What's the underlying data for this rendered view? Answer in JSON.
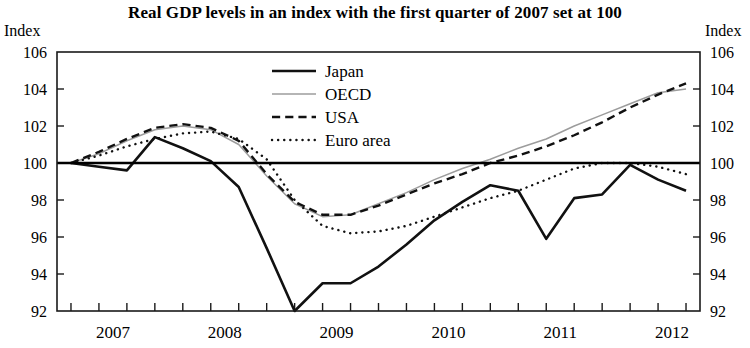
{
  "chart_data": {
    "type": "line",
    "title": "Real GDP levels in an index with the first quarter of 2007 set at 100",
    "xlabel": "",
    "ylabel": "Index",
    "ylabel_right": "Index",
    "ylim": [
      92,
      106
    ],
    "yticks": [
      92,
      94,
      96,
      98,
      100,
      102,
      104,
      106
    ],
    "ytick_labels": [
      "92",
      "94",
      "96",
      "98",
      "100",
      "102",
      "104",
      "106"
    ],
    "xlim": [
      2006.875,
      2012.625
    ],
    "xticks": [
      2007,
      2008,
      2009,
      2010,
      2011,
      2012
    ],
    "xtick_labels": [
      "2007",
      "2008",
      "2009",
      "2010",
      "2011",
      "2012"
    ],
    "x_minor_step": 0.25,
    "grid": false,
    "reference_line": 100,
    "legend_position": "upper center",
    "x": [
      2007.0,
      2007.25,
      2007.5,
      2007.75,
      2008.0,
      2008.25,
      2008.5,
      2008.75,
      2009.0,
      2009.25,
      2009.5,
      2009.75,
      2010.0,
      2010.25,
      2010.5,
      2010.75,
      2011.0,
      2011.25,
      2011.5,
      2011.75,
      2012.0,
      2012.25,
      2012.5
    ],
    "x_labels": [
      "2007Q1",
      "2007Q2",
      "2007Q3",
      "2007Q4",
      "2008Q1",
      "2008Q2",
      "2008Q3",
      "2008Q4",
      "2009Q1",
      "2009Q2",
      "2009Q3",
      "2009Q4",
      "2010Q1",
      "2010Q2",
      "2010Q3",
      "2010Q4",
      "2011Q1",
      "2011Q2",
      "2011Q3",
      "2011Q4",
      "2012Q1",
      "2012Q2",
      "2012Q3"
    ],
    "series": [
      {
        "name": "Japan",
        "style": "solid",
        "width": 2.6,
        "color": "#111111",
        "values": [
          100.0,
          99.8,
          99.6,
          101.4,
          100.8,
          100.1,
          98.7,
          95.4,
          92.0,
          93.5,
          93.5,
          94.4,
          95.6,
          96.9,
          97.9,
          98.8,
          98.5,
          95.9,
          98.1,
          98.3,
          99.9,
          99.1,
          98.5
        ]
      },
      {
        "name": "OECD",
        "style": "solid-thin",
        "width": 1.5,
        "color": "#9c9c9c",
        "values": [
          100.0,
          100.5,
          101.2,
          101.8,
          102.0,
          101.8,
          101.0,
          99.3,
          97.8,
          97.1,
          97.2,
          97.8,
          98.4,
          99.1,
          99.7,
          100.2,
          100.8,
          101.3,
          102.0,
          102.6,
          103.2,
          103.8,
          104.0
        ]
      },
      {
        "name": "USA",
        "style": "dashed",
        "width": 2.4,
        "color": "#111111",
        "values": [
          100.0,
          100.6,
          101.3,
          101.9,
          102.1,
          101.9,
          101.2,
          99.4,
          97.9,
          97.2,
          97.2,
          97.7,
          98.3,
          98.9,
          99.4,
          100.0,
          100.4,
          100.9,
          101.5,
          102.2,
          103.0,
          103.7,
          104.3
        ]
      },
      {
        "name": "Euro area",
        "style": "dotted",
        "width": 2.4,
        "color": "#111111",
        "values": [
          100.0,
          100.4,
          100.9,
          101.3,
          101.6,
          101.7,
          101.3,
          100.2,
          98.0,
          96.6,
          96.2,
          96.3,
          96.6,
          97.1,
          97.6,
          98.1,
          98.5,
          99.1,
          99.7,
          100.0,
          100.0,
          99.8,
          99.4
        ]
      }
    ]
  }
}
